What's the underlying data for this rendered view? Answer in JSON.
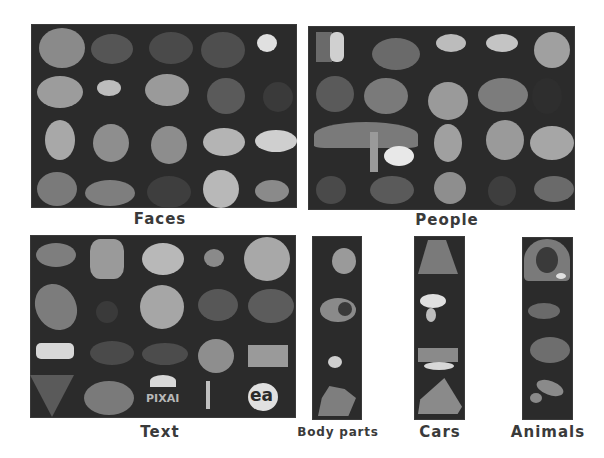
{
  "figure": {
    "panels": [
      {
        "id": "faces",
        "label": "Faces",
        "rows": 4,
        "cols": 5,
        "x": 31,
        "y": 24,
        "w": 266,
        "h": 184,
        "label_x": 160,
        "label_y": 210
      },
      {
        "id": "people",
        "label": "People",
        "rows": 4,
        "cols": 5,
        "x": 308,
        "y": 26,
        "w": 267,
        "h": 184,
        "label_x": 447,
        "label_y": 211
      },
      {
        "id": "text",
        "label": "Text",
        "rows": 4,
        "cols": 5,
        "x": 30,
        "y": 235,
        "w": 266,
        "h": 183,
        "label_x": 160,
        "label_y": 423
      },
      {
        "id": "body-parts",
        "label": "Body parts",
        "rows": 4,
        "cols": 1,
        "x": 312,
        "y": 236,
        "w": 50,
        "h": 184,
        "label_x": 338,
        "label_y": 425
      },
      {
        "id": "cars",
        "label": "Cars",
        "rows": 4,
        "cols": 1,
        "x": 414,
        "y": 236,
        "w": 51,
        "h": 184,
        "label_x": 440,
        "label_y": 423
      },
      {
        "id": "animals",
        "label": "Animals",
        "rows": 4,
        "cols": 1,
        "x": 522,
        "y": 237,
        "w": 51,
        "h": 183,
        "label_x": 548,
        "label_y": 423
      }
    ],
    "visible_text_in_tiles": [
      "PIXAI",
      "ea"
    ]
  },
  "labels": {
    "faces": "Faces",
    "people": "People",
    "text": "Text",
    "body_parts": "Body parts",
    "cars": "Cars",
    "animals": "Animals"
  },
  "tile_text": {
    "pixai": "PIXAI",
    "ea": "ea"
  },
  "colors": {
    "panel_bg": "#2b2b2b",
    "label": "#3a3a3a",
    "page_bg": "#ffffff"
  }
}
